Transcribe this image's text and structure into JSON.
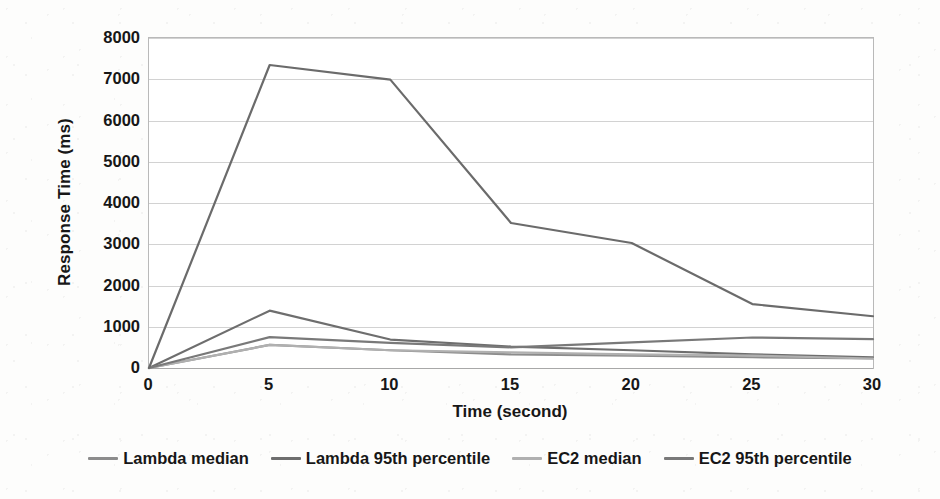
{
  "chart_data": {
    "type": "line",
    "title": "",
    "subtitle": "",
    "xlabel": "Time (second)",
    "ylabel": "Response Time (ms)",
    "x": [
      0,
      5,
      10,
      15,
      20,
      25,
      30
    ],
    "xticklabels": [
      "0",
      "5",
      "10",
      "15",
      "20",
      "25",
      "30"
    ],
    "yticks": [
      0,
      1000,
      2000,
      3000,
      4000,
      5000,
      6000,
      7000,
      8000
    ],
    "yticklabels": [
      "0",
      "1000",
      "2000",
      "3000",
      "4000",
      "5000",
      "6000",
      "7000",
      "8000"
    ],
    "xlim": [
      0,
      30
    ],
    "ylim": [
      0,
      8000
    ],
    "grid": "horizontal",
    "legend_position": "bottom",
    "series": [
      {
        "name": "Lambda median",
        "color": "#8c8c8c",
        "values": [
          0,
          560,
          430,
          330,
          300,
          260,
          230
        ]
      },
      {
        "name": "Lambda 95th percentile",
        "color": "#6e6e6e",
        "values": [
          0,
          1390,
          690,
          520,
          430,
          330,
          260
        ]
      },
      {
        "name": "EC2 median",
        "color": "#b0b0b0",
        "values": [
          0,
          560,
          430,
          380,
          330,
          300,
          230
        ]
      },
      {
        "name": "EC2 95th percentile",
        "color": "#797979",
        "values": [
          0,
          750,
          610,
          500,
          620,
          740,
          700
        ]
      },
      {
        "name": "Lambda cold start 95th percentile",
        "color": "#6b6b6b",
        "values": [
          0,
          7345,
          6990,
          3515,
          3030,
          1550,
          1255
        ]
      }
    ],
    "legend_entries": [
      "Lambda median",
      "Lambda 95th percentile",
      "EC2 median",
      "EC2 95th percentile"
    ]
  }
}
